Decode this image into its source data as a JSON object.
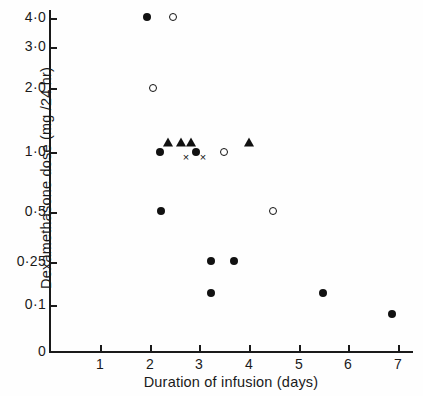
{
  "chart_data": {
    "type": "scatter",
    "title": "",
    "xlabel": "Duration of infusion (days)",
    "ylabel": "Dexamethasone dose (mg /24 hr)",
    "xlim": [
      0,
      7.5
    ],
    "ylim_note": "logarithmic dose axis, 0 shown at origin",
    "grid": false,
    "legend_position": "none",
    "xticks": [
      {
        "label": "1",
        "value": 1,
        "px": 100
      },
      {
        "label": "2",
        "value": 2,
        "px": 150
      },
      {
        "label": "3",
        "value": 3,
        "px": 199
      },
      {
        "label": "4",
        "value": 4,
        "px": 249
      },
      {
        "label": "5",
        "value": 5,
        "px": 299
      },
      {
        "label": "6",
        "value": 6,
        "px": 348
      },
      {
        "label": "7",
        "value": 7,
        "px": 398
      }
    ],
    "yticks": [
      {
        "label": "4·0",
        "value": 4.0,
        "px": 18
      },
      {
        "label": "3·0",
        "value": 3.0,
        "px": 47
      },
      {
        "label": "2·0",
        "value": 2.0,
        "px": 88
      },
      {
        "label": "1·0",
        "value": 1.0,
        "px": 152
      },
      {
        "label": "0·5",
        "value": 0.5,
        "px": 212
      },
      {
        "label": "0·25",
        "value": 0.25,
        "px": 262
      },
      {
        "label": "0·1",
        "value": 0.1,
        "px": 305
      },
      {
        "label": "0",
        "value": 0,
        "px": 352
      }
    ],
    "series": [
      {
        "name": "filled-circle",
        "marker": "filled-circle",
        "points": [
          {
            "x": 1.95,
            "y": 4.0,
            "px": 147,
            "py": 17
          },
          {
            "x": 2.2,
            "y": 1.0,
            "px": 160,
            "py": 152
          },
          {
            "x": 2.95,
            "y": 1.0,
            "px": 196,
            "py": 152
          },
          {
            "x": 2.25,
            "y": 0.5,
            "px": 161,
            "py": 211
          },
          {
            "x": 3.25,
            "y": 0.26,
            "px": 211,
            "py": 261
          },
          {
            "x": 3.7,
            "y": 0.26,
            "px": 234,
            "py": 261
          },
          {
            "x": 3.25,
            "y": 0.14,
            "px": 211,
            "py": 293
          },
          {
            "x": 5.5,
            "y": 0.14,
            "px": 323,
            "py": 293
          },
          {
            "x": 6.9,
            "y": 0.08,
            "px": 392,
            "py": 314
          }
        ]
      },
      {
        "name": "open-circle",
        "marker": "open-circle",
        "points": [
          {
            "x": 2.45,
            "y": 4.0,
            "px": 173,
            "py": 17
          },
          {
            "x": 2.05,
            "y": 2.0,
            "px": 153,
            "py": 88
          },
          {
            "x": 3.5,
            "y": 1.0,
            "px": 224,
            "py": 152
          },
          {
            "x": 4.5,
            "y": 0.5,
            "px": 273,
            "py": 211
          }
        ]
      },
      {
        "name": "triangle",
        "marker": "triangle",
        "points": [
          {
            "x": 2.37,
            "y": 1.15,
            "px": 168,
            "py": 142
          },
          {
            "x": 2.63,
            "y": 1.15,
            "px": 181,
            "py": 142
          },
          {
            "x": 2.83,
            "y": 1.15,
            "px": 191,
            "py": 142
          },
          {
            "x": 4.0,
            "y": 1.15,
            "px": 249,
            "py": 142
          }
        ]
      },
      {
        "name": "cross",
        "marker": "cross",
        "points": [
          {
            "x": 2.73,
            "y": 0.92,
            "px": 186,
            "py": 157
          },
          {
            "x": 3.07,
            "y": 0.92,
            "px": 203,
            "py": 157
          }
        ]
      }
    ]
  }
}
